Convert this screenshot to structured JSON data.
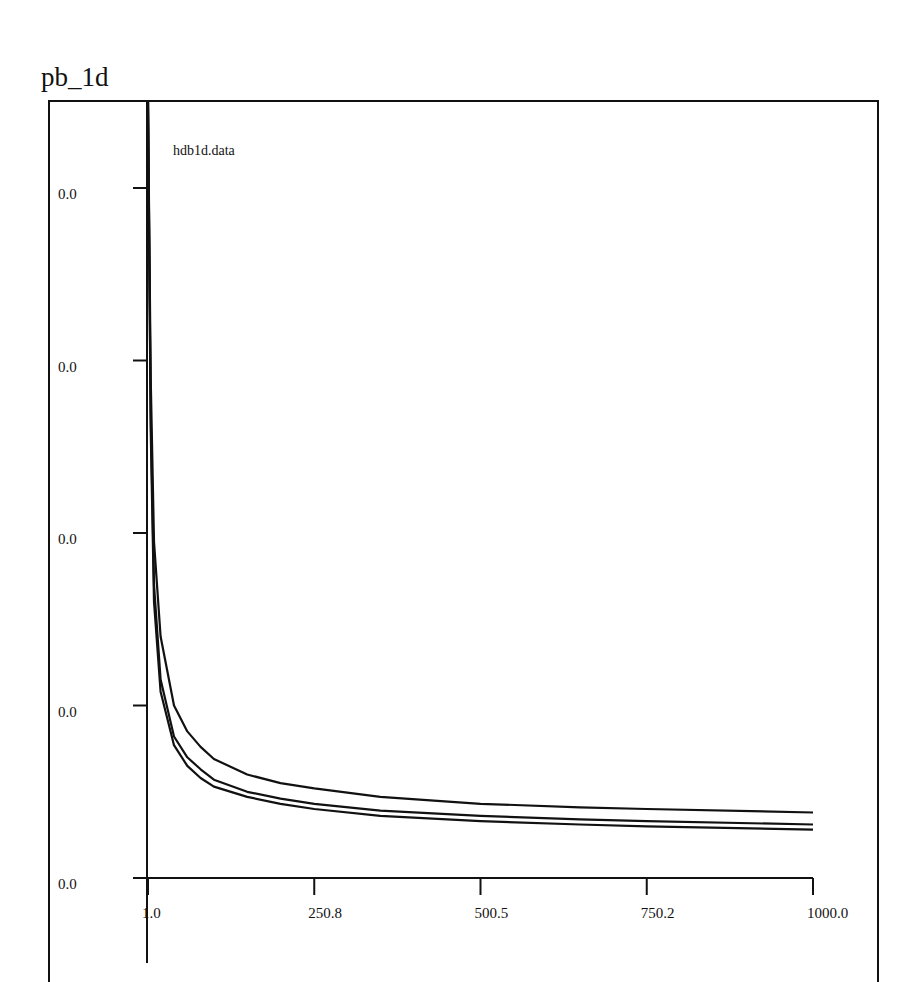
{
  "page": {
    "title": "pb_1d"
  },
  "chart_data": {
    "type": "line",
    "title": "pb_1d",
    "annotation": "hdb1d.data",
    "xlabel": "",
    "ylabel": "",
    "xlim": [
      1.0,
      1000.0
    ],
    "x_ticks": [
      "1.0",
      "250.8",
      "500.5",
      "750.2",
      "1000.0"
    ],
    "y_ticks": [
      "0.0",
      "0.0",
      "0.0",
      "0.0",
      "0.0"
    ],
    "grid": false,
    "legend": null,
    "note": "Y tick labels are all rendered as 0.0; y values below are given in relative units (0 = bottom axis, 4 = top tick) read from pixel positions.",
    "x": [
      1,
      5,
      10,
      20,
      40,
      60,
      80,
      100,
      150,
      200,
      250.8,
      350,
      500.5,
      650,
      750.2,
      1000
    ],
    "series": [
      {
        "name": "curve-1",
        "values": [
          4.6,
          2.9,
          1.95,
          1.4,
          1.0,
          0.85,
          0.76,
          0.69,
          0.6,
          0.55,
          0.52,
          0.47,
          0.43,
          0.41,
          0.4,
          0.38
        ]
      },
      {
        "name": "curve-2",
        "values": [
          4.6,
          2.7,
          1.7,
          1.15,
          0.82,
          0.7,
          0.63,
          0.57,
          0.5,
          0.46,
          0.43,
          0.39,
          0.36,
          0.34,
          0.33,
          0.31
        ]
      },
      {
        "name": "curve-3",
        "values": [
          4.6,
          2.6,
          1.6,
          1.08,
          0.77,
          0.65,
          0.58,
          0.53,
          0.47,
          0.43,
          0.4,
          0.36,
          0.33,
          0.31,
          0.3,
          0.28
        ]
      }
    ]
  }
}
